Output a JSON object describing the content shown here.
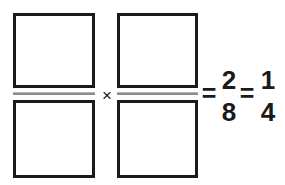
{
  "problem": {
    "type": "fraction-multiplication",
    "statement": "□/□ × □/□ = 2/8 = 1/4",
    "operands": [
      {
        "label": "first-fraction",
        "numerator_value": "",
        "denominator_value": "",
        "numerator_placeholder": "",
        "denominator_placeholder": ""
      },
      {
        "label": "second-fraction",
        "numerator_value": "",
        "denominator_value": "",
        "numerator_placeholder": "",
        "denominator_placeholder": ""
      }
    ],
    "operators": {
      "multiply": "×",
      "equals_first": "=",
      "equals_second": "="
    },
    "results": [
      {
        "label": "product",
        "numerator": "2",
        "denominator": "8"
      },
      {
        "label": "simplified",
        "numerator": "1",
        "denominator": "4"
      }
    ]
  },
  "colors": {
    "ink": "#1a1a1a",
    "fraction_bar": "#8c8c8c",
    "fraction_bar_highlight": "#b5b5b5",
    "background": "#ffffff"
  }
}
